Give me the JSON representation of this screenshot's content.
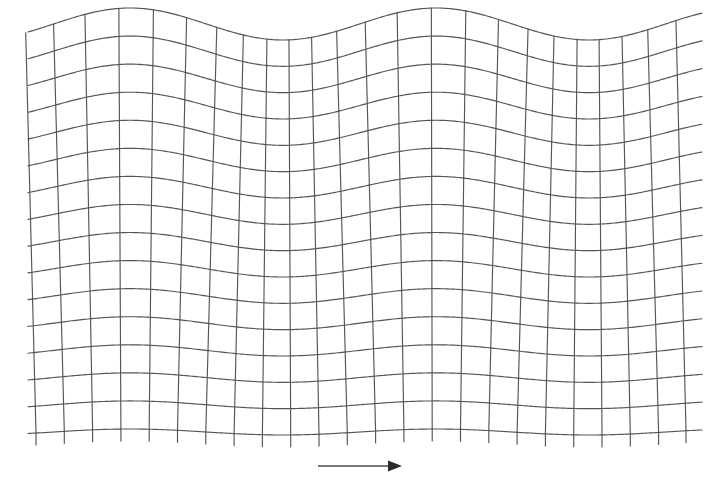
{
  "figure": {
    "background_color": "#ffffff",
    "line_color": "#555555",
    "arrow_color": "#2b2b2b",
    "width": 712,
    "height": 495
  },
  "grid": {
    "x_start": 36,
    "x_end": 686,
    "y_start": 24,
    "y_end": 432,
    "n_vertical_lines": 24,
    "n_horizontal_lines": 16,
    "vertical_spacing": 28.3,
    "horizontal_spacing": 27.2,
    "tick_overhang": 12,
    "right_overhang": 16,
    "left_overhang": 8
  },
  "wave": {
    "wavelength": 306,
    "phase_offset": 130,
    "amplitude_top": 16,
    "amplitude_bottom": 3,
    "decay": "linear",
    "peaks_x": [
      130,
      436
    ],
    "troughs_x": [
      283,
      589
    ],
    "tilt_factor": 11
  },
  "arrow": {
    "label": "propagation-direction",
    "x_start": 318,
    "x_end": 402,
    "y": 466,
    "head_length": 14,
    "head_half_width": 5.5
  },
  "chart_data": {
    "type": "line",
    "subtitle": "",
    "xlabel": "",
    "ylabel": "",
    "grid": true,
    "legend": null,
    "xlim": [
      36,
      686
    ],
    "ylim": [
      24,
      432
    ],
    "annotations": [
      {
        "type": "arrow",
        "text": "",
        "direction": "right",
        "x": [
          318,
          402
        ],
        "y": 466,
        "meaning": "direction of wave propagation"
      }
    ],
    "series": [
      {
        "name": "horizontal-wave-lines",
        "count": 16,
        "description": "Sinusoidal horizontal lines, amplitude decaying with depth",
        "wavelength": 306,
        "amplitudes": [
          16.0,
          15.1,
          14.3,
          13.4,
          12.6,
          11.7,
          10.9,
          10.0,
          9.1,
          8.3,
          7.4,
          6.6,
          5.7,
          4.9,
          4.0,
          3.0
        ],
        "baseline_y": [
          24.0,
          51.2,
          78.4,
          105.6,
          132.8,
          160.0,
          187.2,
          214.4,
          241.6,
          268.8,
          296.0,
          323.2,
          350.4,
          377.6,
          404.8,
          432.0
        ]
      },
      {
        "name": "vertical-grid-lines",
        "count": 24,
        "description": "Near-vertical lines curved to stay normal to the wave surface",
        "base_x": [
          36,
          64.3,
          92.6,
          120.9,
          149.2,
          177.5,
          205.8,
          234.1,
          262.4,
          290.7,
          319.0,
          347.3,
          375.6,
          403.9,
          432.2,
          460.5,
          488.8,
          517.1,
          545.4,
          573.7,
          602.0,
          630.3,
          658.6,
          686.0
        ]
      }
    ]
  }
}
